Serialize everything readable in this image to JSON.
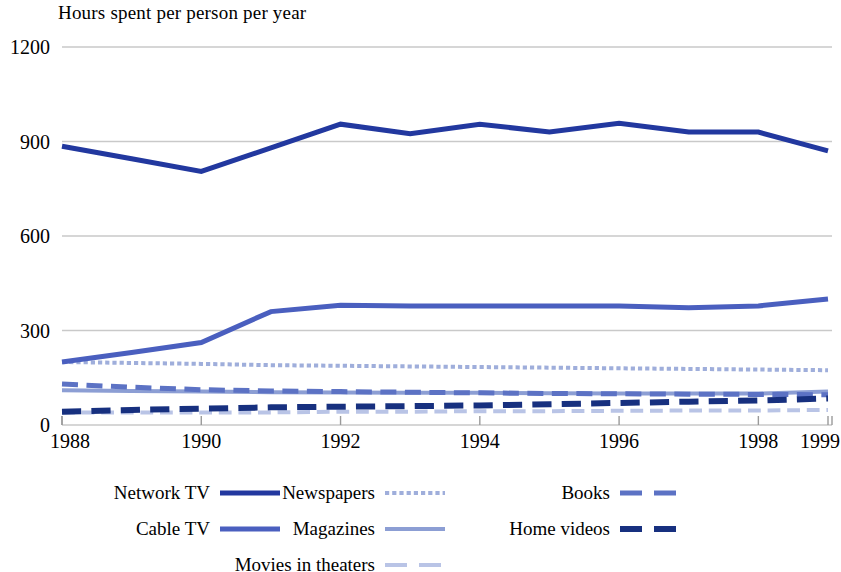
{
  "chart_data": {
    "type": "line",
    "title": "Hours spent per person per year",
    "xlabel": "",
    "ylabel": "",
    "ylim": [
      0,
      1200
    ],
    "yticks": [
      0,
      300,
      600,
      900,
      1200
    ],
    "ytick_labels": [
      "0",
      "300",
      "600",
      "900",
      "1200"
    ],
    "grid": true,
    "legend_position": "below",
    "x": [
      1988,
      1989,
      1990,
      1991,
      1992,
      1993,
      1994,
      1995,
      1996,
      1997,
      1998,
      1999
    ],
    "xtick_labels": [
      "1988",
      "1990",
      "1992",
      "1994",
      "1996",
      "1998",
      "1999"
    ],
    "xticks": [
      1988,
      1990,
      1992,
      1994,
      1996,
      1998,
      1999
    ],
    "series": [
      {
        "name": "Network TV",
        "color": "#22389F",
        "style": "solid",
        "width": 5,
        "values": [
          885,
          845,
          805,
          880,
          955,
          925,
          955,
          930,
          958,
          930,
          930,
          870
        ]
      },
      {
        "name": "Cable TV",
        "color": "#4A5FBF",
        "style": "solid",
        "width": 5,
        "values": [
          200,
          230,
          262,
          360,
          380,
          378,
          378,
          378,
          378,
          372,
          378,
          400
        ]
      },
      {
        "name": "Newspapers",
        "color": "#9FAEDB",
        "style": "dotted",
        "width": 4,
        "values": [
          200,
          197,
          194,
          190,
          188,
          186,
          184,
          182,
          180,
          178,
          176,
          174
        ]
      },
      {
        "name": "Magazines",
        "color": "#8C9ED4",
        "style": "solid",
        "width": 4,
        "values": [
          110,
          108,
          106,
          104,
          103,
          102,
          102,
          101,
          100,
          100,
          100,
          106
        ]
      },
      {
        "name": "Movies in theaters",
        "color": "#B9C4E6",
        "style": "dashed",
        "width": 4,
        "values": [
          40,
          40,
          40,
          40,
          42,
          42,
          44,
          44,
          45,
          46,
          46,
          48
        ]
      },
      {
        "name": "Books",
        "color": "#5C72C4",
        "style": "dashed",
        "width": 5,
        "values": [
          130,
          120,
          112,
          108,
          106,
          104,
          102,
          100,
          99,
          98,
          97,
          96
        ]
      },
      {
        "name": "Home videos",
        "color": "#17307F",
        "style": "dashed",
        "width": 6,
        "values": [
          42,
          48,
          52,
          56,
          58,
          60,
          62,
          66,
          70,
          74,
          78,
          84
        ]
      }
    ]
  },
  "legend": {
    "columns": [
      {
        "items": [
          "Network TV",
          "Cable TV"
        ]
      },
      {
        "items": [
          "Newspapers",
          "Magazines",
          "Movies in theaters"
        ]
      },
      {
        "items": [
          "Books",
          "Home videos"
        ]
      }
    ],
    "labels": {
      "network_tv": "Network TV",
      "cable_tv": "Cable TV",
      "newspapers": "Newspapers",
      "magazines": "Magazines",
      "movies_in_theaters": "Movies in theaters",
      "books": "Books",
      "home_videos": "Home videos"
    }
  },
  "colors": {
    "grid": "#c9c9c9",
    "axis": "#9a9a9a",
    "network_tv": "#22389F",
    "cable_tv": "#4A5FBF",
    "newspapers": "#9FAEDB",
    "magazines": "#8C9ED4",
    "movies_in_theaters": "#B9C4E6",
    "books": "#5C72C4",
    "home_videos": "#17307F"
  }
}
